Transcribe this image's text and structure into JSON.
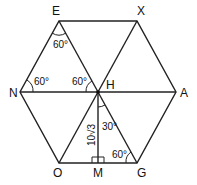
{
  "diagram": {
    "type": "regular hexagon subdivided into equilateral triangles",
    "vertices": {
      "E": {
        "label": "E",
        "x": 59,
        "y": 21
      },
      "X": {
        "label": "X",
        "x": 137,
        "y": 21
      },
      "N": {
        "label": "N",
        "x": 20,
        "y": 92
      },
      "A": {
        "label": "A",
        "x": 176,
        "y": 92
      },
      "H": {
        "label": "H",
        "x": 98,
        "y": 92
      },
      "O": {
        "label": "O",
        "x": 59,
        "y": 163
      },
      "G": {
        "label": "G",
        "x": 137,
        "y": 163
      },
      "M": {
        "label": "M",
        "x": 98,
        "y": 163
      }
    },
    "angles": {
      "at_E": "60°",
      "at_N": "60°",
      "at_H_left": "60°",
      "at_H_down": "30°",
      "at_G": "60°"
    },
    "segment_HM": "10√3",
    "right_angle_at": "M"
  }
}
